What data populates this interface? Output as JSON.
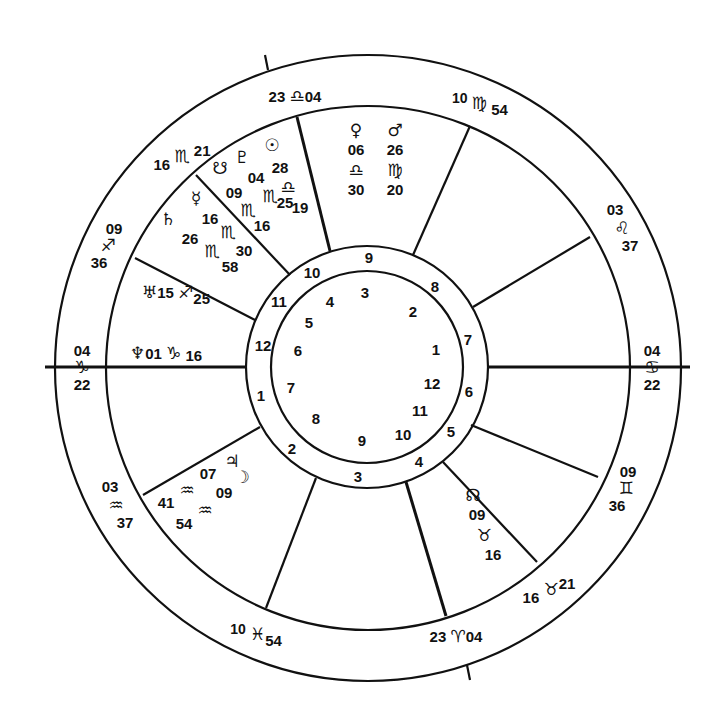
{
  "chart": {
    "type": "natal-wheel",
    "center": [
      367,
      367
    ],
    "radii": {
      "outer": 313,
      "signs": 262,
      "houses_outer": 121,
      "houses_inner": 96
    },
    "line_color": "#111111",
    "background": "#ffffff"
  },
  "cusps": [
    {
      "id": "mc",
      "label_deg": "23",
      "sign": "♎",
      "label_min": "04",
      "sign_name": "libra",
      "x": 300,
      "y": 97
    },
    {
      "id": "c11",
      "label_deg": "10",
      "sign": "♍",
      "label_min": "54",
      "sign_name": "virgo",
      "x": 478,
      "y": 103
    },
    {
      "id": "c12",
      "label_deg": "03",
      "sign": "♌",
      "label_min": "37",
      "sign_name": "leo",
      "x": 622,
      "y": 227
    },
    {
      "id": "asc",
      "label_deg": "04",
      "sign": "♋",
      "label_min": "22",
      "sign_name": "cancer",
      "x": 652,
      "y": 367
    },
    {
      "id": "c2",
      "label_deg": "09",
      "sign": "♊",
      "label_min": "36",
      "sign_name": "gemini",
      "x": 614,
      "y": 488
    },
    {
      "id": "c3",
      "label_deg": "16",
      "sign": "♉",
      "label_min": "21",
      "sign_name": "taurus",
      "x": 528,
      "y": 589
    },
    {
      "id": "ic",
      "label_deg": "23",
      "sign": "♈",
      "label_min": "04",
      "sign_name": "aries",
      "x": 436,
      "y": 640
    },
    {
      "id": "c5",
      "label_deg": "10",
      "sign": "♓",
      "label_min": "54",
      "sign_name": "pisces",
      "x": 256,
      "y": 634
    },
    {
      "id": "c6",
      "label_deg": "03",
      "sign": "♒",
      "label_min": "37",
      "sign_name": "aquarius",
      "x": 112,
      "y": 506
    },
    {
      "id": "dsc",
      "label_deg": "04",
      "sign": "♑",
      "label_min": "22",
      "sign_name": "capricorn",
      "x": 82,
      "y": 367
    },
    {
      "id": "c8",
      "label_deg": "09",
      "sign": "♐",
      "label_min": "36",
      "sign_name": "sagittarius",
      "x": 110,
      "y": 245
    },
    {
      "id": "c9",
      "label_deg": "16",
      "sign": "♏",
      "label_min": "21",
      "sign_name": "scorpio",
      "x": 184,
      "y": 147
    }
  ],
  "planets": [
    {
      "name": "venus",
      "glyph": "♀",
      "deg": "06",
      "sign": "♎",
      "min": "30"
    },
    {
      "name": "mars",
      "glyph": "♂",
      "deg": "26",
      "sign": "♍",
      "min": "20"
    },
    {
      "name": "pluto",
      "glyph": "♇",
      "deg": "04",
      "sign": "♏",
      "min": "25"
    },
    {
      "name": "sun",
      "glyph": "☉",
      "deg": "28",
      "sign": "♎",
      "min": "19"
    },
    {
      "name": "south-node",
      "glyph": "☋",
      "deg": "09",
      "sign": "♏",
      "min": "16"
    },
    {
      "name": "mercury",
      "glyph": "☿",
      "deg": "16",
      "sign": "♏",
      "min": "30"
    },
    {
      "name": "saturn",
      "glyph": "♄",
      "deg": "26",
      "sign": "♏",
      "min": "58"
    },
    {
      "name": "uranus",
      "glyph": "♅",
      "deg": "15",
      "sign": "♐",
      "min": "25"
    },
    {
      "name": "neptune",
      "glyph": "♆",
      "deg": "01",
      "sign": "♑",
      "min": "16"
    },
    {
      "name": "jupiter",
      "glyph": "♃",
      "deg": "07",
      "sign": "♒",
      "min": "41"
    },
    {
      "name": "moon",
      "glyph": "☽",
      "deg": "09",
      "sign": "♒",
      "min": "54"
    },
    {
      "name": "north-node",
      "glyph": "☊",
      "deg": "09",
      "sign": "♉",
      "min": "16"
    }
  ],
  "ring_numbers_outer": [
    {
      "t": "9",
      "x": 369,
      "y": 258
    },
    {
      "t": "8",
      "x": 435,
      "y": 287
    },
    {
      "t": "7",
      "x": 468,
      "y": 340
    },
    {
      "t": "6",
      "x": 469,
      "y": 392
    },
    {
      "t": "5",
      "x": 451,
      "y": 432
    },
    {
      "t": "4",
      "x": 419,
      "y": 462
    },
    {
      "t": "3",
      "x": 358,
      "y": 477
    },
    {
      "t": "2",
      "x": 292,
      "y": 449
    },
    {
      "t": "1",
      "x": 261,
      "y": 396
    },
    {
      "t": "12",
      "x": 263,
      "y": 346
    },
    {
      "t": "11",
      "x": 279,
      "y": 302
    },
    {
      "t": "10",
      "x": 312,
      "y": 273
    }
  ],
  "ring_numbers_inner": [
    {
      "t": "3",
      "x": 365,
      "y": 293
    },
    {
      "t": "2",
      "x": 413,
      "y": 312
    },
    {
      "t": "1",
      "x": 436,
      "y": 350
    },
    {
      "t": "12",
      "x": 432,
      "y": 384
    },
    {
      "t": "11",
      "x": 420,
      "y": 411
    },
    {
      "t": "10",
      "x": 403,
      "y": 435
    },
    {
      "t": "9",
      "x": 362,
      "y": 441
    },
    {
      "t": "8",
      "x": 316,
      "y": 419
    },
    {
      "t": "7",
      "x": 291,
      "y": 388
    },
    {
      "t": "6",
      "x": 298,
      "y": 351
    },
    {
      "t": "5",
      "x": 309,
      "y": 323
    },
    {
      "t": "4",
      "x": 330,
      "y": 302
    }
  ]
}
